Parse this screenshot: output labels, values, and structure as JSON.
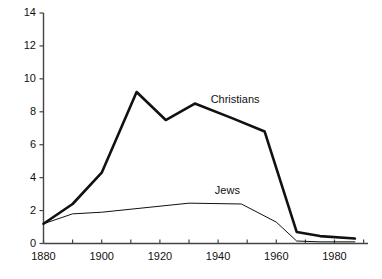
{
  "chart_data": {
    "type": "line",
    "title": "",
    "subtitle": "",
    "xlabel": "",
    "ylabel": "",
    "xlim": [
      1880,
      1990
    ],
    "ylim": [
      0,
      14
    ],
    "grid": false,
    "legend_position": "inline-annotations",
    "x_ticks": [
      1880,
      1900,
      1920,
      1940,
      1960,
      1980
    ],
    "x_minor_ticks": [
      1890,
      1910,
      1930,
      1950,
      1970,
      1990
    ],
    "y_ticks": [
      0,
      2,
      4,
      6,
      8,
      10,
      12,
      14
    ],
    "x_tick_labels": [
      "1880",
      "1900",
      "1920",
      "1940",
      "1960",
      "1980"
    ],
    "y_tick_labels": [
      "0",
      "2",
      "4",
      "6",
      "8",
      "10",
      "12",
      "14"
    ],
    "series": [
      {
        "name": "Christians",
        "color": "#111111",
        "line_width": 2.6,
        "annotation": "Christians",
        "x": [
          1880,
          1890,
          1900,
          1912,
          1922,
          1932,
          1945,
          1956,
          1967,
          1975,
          1987
        ],
        "values": [
          1.2,
          2.4,
          4.3,
          9.2,
          7.5,
          8.5,
          7.6,
          6.8,
          0.7,
          0.45,
          0.3
        ]
      },
      {
        "name": "Jews",
        "color": "#111111",
        "line_width": 1.0,
        "annotation": "Jews",
        "x": [
          1880,
          1890,
          1900,
          1930,
          1948,
          1960,
          1967,
          1975,
          1987
        ],
        "values": [
          1.2,
          1.8,
          1.9,
          2.45,
          2.4,
          1.3,
          0.15,
          0.1,
          0.1
        ]
      }
    ],
    "annotations": [
      {
        "text": "Christians",
        "x": 1945,
        "y": 8.7
      },
      {
        "text": "Jews",
        "x": 1943,
        "y": 3.2
      }
    ]
  },
  "axes": {
    "axis_color": "#444444",
    "tick_color": "#444444"
  }
}
